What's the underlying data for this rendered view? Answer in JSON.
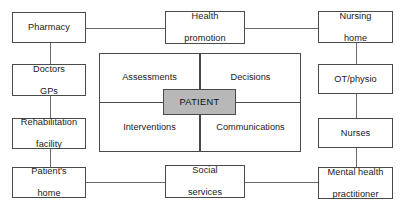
{
  "diagram": {
    "colors": {
      "box_border": "#4a4a4a",
      "box_fill": "#ffffff",
      "patient_fill": "#b8b8b8",
      "connector": "#6a6a6a",
      "text": "#1a1a1a",
      "background": "#ffffff"
    },
    "center": {
      "label": "PATIENT",
      "quadrants": [
        {
          "id": "assessments",
          "label": "Assessments",
          "position": "top-left"
        },
        {
          "id": "decisions",
          "label": "Decisions",
          "position": "top-right"
        },
        {
          "id": "interventions",
          "label": "Interventions",
          "position": "bottom-left"
        },
        {
          "id": "communications",
          "label": "Communications",
          "position": "bottom-right"
        }
      ]
    },
    "nodes": [
      {
        "id": "pharmacy",
        "label": "Pharmacy",
        "lines": [
          "Pharmacy"
        ],
        "column": "left",
        "row": 1
      },
      {
        "id": "doctors-gps",
        "label": "Doctors GPs",
        "lines": [
          "Doctors",
          "GPs"
        ],
        "column": "left",
        "row": 2
      },
      {
        "id": "rehabilitation-facility",
        "label": "Rehabilitation facility",
        "lines": [
          "Rehabilitation",
          "facility"
        ],
        "column": "left",
        "row": 3
      },
      {
        "id": "patients-home",
        "label": "Patient's home",
        "lines": [
          "Patient's",
          "home"
        ],
        "column": "left",
        "row": 4
      },
      {
        "id": "health-promotion",
        "label": "Health promotion",
        "lines": [
          "Health",
          "promotion"
        ],
        "column": "center",
        "row": 1
      },
      {
        "id": "social-services",
        "label": "Social services",
        "lines": [
          "Social",
          "services"
        ],
        "column": "center",
        "row": 4
      },
      {
        "id": "nursing-home",
        "label": "Nursing home",
        "lines": [
          "Nursing",
          "home"
        ],
        "column": "right",
        "row": 1
      },
      {
        "id": "ot-physio",
        "label": "OT/physio",
        "lines": [
          "OT/physio"
        ],
        "column": "right",
        "row": 2
      },
      {
        "id": "nurses",
        "label": "Nurses",
        "lines": [
          "Nurses"
        ],
        "column": "right",
        "row": 3
      },
      {
        "id": "mental-health-practitioner",
        "label": "Mental health practitioner",
        "lines": [
          "Mental health",
          "practitioner"
        ],
        "column": "right",
        "row": 4
      }
    ],
    "connections": [
      {
        "from": "pharmacy",
        "to": "health-promotion",
        "orientation": "horizontal"
      },
      {
        "from": "health-promotion",
        "to": "nursing-home",
        "orientation": "horizontal"
      },
      {
        "from": "pharmacy",
        "to": "doctors-gps",
        "orientation": "vertical"
      },
      {
        "from": "doctors-gps",
        "to": "rehabilitation-facility",
        "orientation": "vertical"
      },
      {
        "from": "rehabilitation-facility",
        "to": "patients-home",
        "orientation": "vertical"
      },
      {
        "from": "patients-home",
        "to": "social-services",
        "orientation": "horizontal"
      },
      {
        "from": "social-services",
        "to": "mental-health-practitioner",
        "orientation": "horizontal"
      },
      {
        "from": "nursing-home",
        "to": "ot-physio",
        "orientation": "vertical"
      },
      {
        "from": "ot-physio",
        "to": "nurses",
        "orientation": "vertical"
      },
      {
        "from": "nurses",
        "to": "mental-health-practitioner",
        "orientation": "vertical"
      }
    ]
  }
}
